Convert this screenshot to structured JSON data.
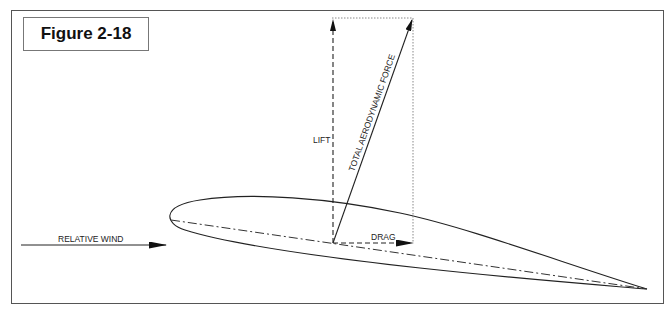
{
  "figure": {
    "label": "Figure 2-18"
  },
  "diagram": {
    "type": "airfoil-force-vectors",
    "labels": {
      "lift": "LIFT",
      "total_force": "TOTAL AERODYNAMIC FORCE",
      "drag": "DRAG",
      "relative_wind": "RELATIVE WIND"
    },
    "colors": {
      "line": "#222222",
      "frame": "#555555",
      "dotted": "#888888"
    }
  }
}
